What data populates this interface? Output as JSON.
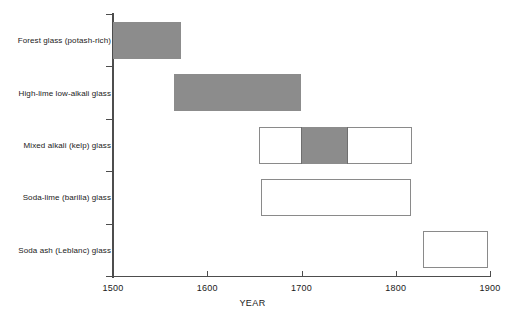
{
  "chart_data": {
    "type": "bar",
    "orientation": "horizontal",
    "title": "",
    "xlabel": "YEAR",
    "ylabel": "",
    "xlim": [
      1500,
      1900
    ],
    "xticks": [
      1500,
      1600,
      1700,
      1800,
      1900
    ],
    "xtick_labels": [
      "1500",
      "1600",
      "1700",
      "1800",
      "1900"
    ],
    "grid": false,
    "legend": false,
    "categories": [
      "Forest glass (potash-rich)",
      "High-lime low-alkali glass",
      "Mixed alkali (kelp) glass",
      "Soda-lime (barilla) glass",
      "Soda ash (Leblanc) glass"
    ],
    "bars": [
      {
        "category": "Forest glass (potash-rich)",
        "start": 1500,
        "end": 1572,
        "style": "filled",
        "fill_color": "#8c8c8c",
        "sub_range": null
      },
      {
        "category": "High-lime low-alkali glass",
        "start": 1565,
        "end": 1700,
        "style": "filled",
        "fill_color": "#8c8c8c",
        "sub_range": null
      },
      {
        "category": "Mixed alkali (kelp) glass",
        "start": 1655,
        "end": 1817,
        "style": "hollow",
        "fill_color": "#ffffff",
        "sub_range": {
          "start": 1699,
          "end": 1749,
          "fill_color": "#8c8c8c"
        }
      },
      {
        "category": "Soda-lime (barilla) glass",
        "start": 1657,
        "end": 1816,
        "style": "hollow",
        "fill_color": "#ffffff",
        "sub_range": null
      },
      {
        "category": "Soda ash (Leblanc) glass",
        "start": 1829,
        "end": 1898,
        "style": "hollow",
        "fill_color": "#ffffff",
        "sub_range": null
      }
    ]
  }
}
